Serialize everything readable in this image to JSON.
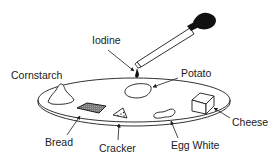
{
  "diagram": {
    "type": "labeled-illustration",
    "labels": {
      "iodine": "Iodine",
      "potato": "Potato",
      "cornstarch": "Cornstarch",
      "bread": "Bread",
      "cracker": "Cracker",
      "egg_white": "Egg White",
      "cheese": "Cheese"
    },
    "items": [
      {
        "name": "Iodine",
        "object": "dropper"
      },
      {
        "name": "Potato",
        "object": "slice"
      },
      {
        "name": "Cornstarch",
        "object": "mound"
      },
      {
        "name": "Bread",
        "object": "square"
      },
      {
        "name": "Cracker",
        "object": "triangle"
      },
      {
        "name": "Egg White",
        "object": "blob"
      },
      {
        "name": "Cheese",
        "object": "cube"
      }
    ],
    "colors": {
      "line": "#1a1a1a",
      "background": "#ffffff",
      "bread_fill": "#8a8a8a",
      "dropper_bulb": "#111111"
    }
  }
}
